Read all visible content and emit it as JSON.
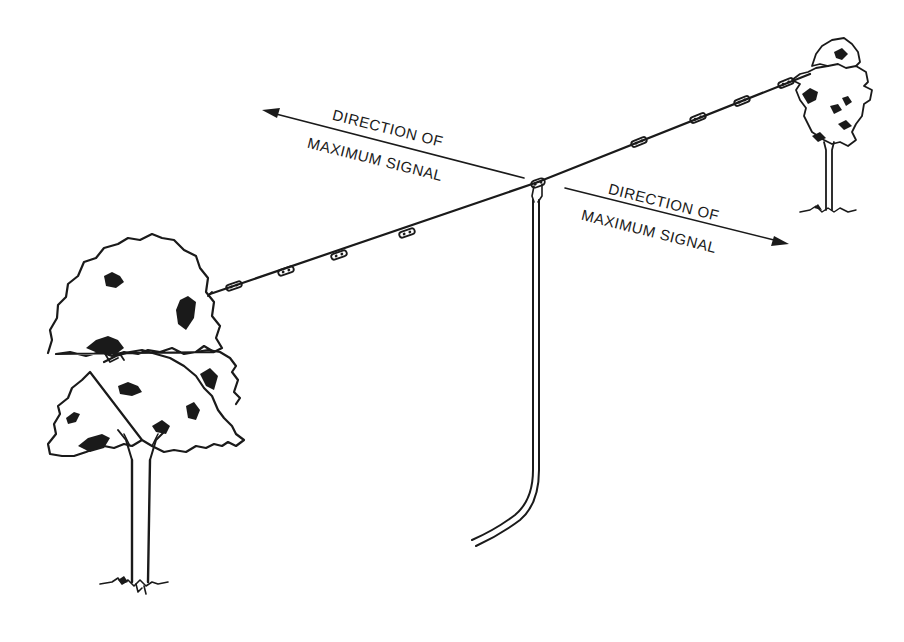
{
  "diagram": {
    "type": "dipole-antenna-illustration",
    "labels": {
      "left_arrow_line1": "DIRECTION OF",
      "left_arrow_line2": "MAXIMUM SIGNAL",
      "right_arrow_line1": "DIRECTION OF",
      "right_arrow_line2": "MAXIMUM SIGNAL"
    },
    "elements": {
      "left_tree": "large-tree-icon",
      "right_tree": "small-tree-icon",
      "antenna_wire": "dipole-wire",
      "center_insulator": "center-insulator-icon",
      "feedline": "twin-lead-feedline",
      "left_arrow": "arrow-left-icon",
      "right_arrow": "arrow-right-icon",
      "insulators_left_count": 4,
      "insulators_right_count": 4
    },
    "colors": {
      "ink": "#1a1a1a",
      "background": "#ffffff"
    }
  }
}
